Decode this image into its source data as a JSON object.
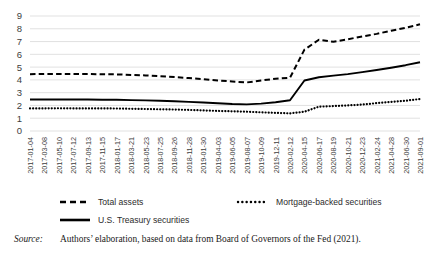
{
  "figure": {
    "source_label": "Source:",
    "source_text": "Authors’ elaboration, based on data from Board of Governors of the Fed (2021)."
  },
  "chart_data": {
    "type": "line",
    "title": "",
    "xlabel": "",
    "ylabel": "",
    "ylim": [
      0,
      9
    ],
    "yticks": [
      0,
      1,
      2,
      3,
      4,
      5,
      6,
      7,
      8,
      9
    ],
    "grid": true,
    "legend_position": "bottom",
    "colors": {
      "line": "#000000",
      "grid": "#d9d9d9",
      "text": "#3d3d3d"
    },
    "categories": [
      "2017-01-04",
      "2017-03-08",
      "2017-05-10",
      "2017-07-12",
      "2017-09-13",
      "2017-11-15",
      "2018-01-17",
      "2018-03-21",
      "2018-05-23",
      "2018-07-25",
      "2018-09-26",
      "2018-11-28",
      "2019-01-30",
      "2019-04-03",
      "2019-06-05",
      "2019-08-07",
      "2019-10-09",
      "2019-12-11",
      "2020-02-12",
      "2020-04-15",
      "2020-06-17",
      "2020-08-19",
      "2020-10-21",
      "2020-12-23",
      "2021-02-24",
      "2021-04-28",
      "2021-06-30",
      "2021-09-01"
    ],
    "series": [
      {
        "name": "Total assets",
        "style": "dashed",
        "values": [
          4.45,
          4.47,
          4.47,
          4.47,
          4.46,
          4.44,
          4.43,
          4.39,
          4.35,
          4.29,
          4.22,
          4.14,
          4.06,
          3.96,
          3.87,
          3.8,
          3.95,
          4.09,
          4.17,
          6.37,
          7.14,
          6.98,
          7.18,
          7.4,
          7.6,
          7.85,
          8.08,
          8.35
        ]
      },
      {
        "name": "Mortgage-backed securities",
        "style": "dotted",
        "values": [
          1.77,
          1.77,
          1.78,
          1.77,
          1.77,
          1.77,
          1.76,
          1.74,
          1.72,
          1.7,
          1.68,
          1.65,
          1.61,
          1.57,
          1.54,
          1.51,
          1.46,
          1.42,
          1.38,
          1.51,
          1.9,
          1.95,
          2.0,
          2.07,
          2.18,
          2.27,
          2.37,
          2.5
        ]
      },
      {
        "name": "U.S. Treasury securities",
        "style": "solid",
        "values": [
          2.46,
          2.46,
          2.46,
          2.46,
          2.46,
          2.45,
          2.45,
          2.42,
          2.4,
          2.37,
          2.33,
          2.28,
          2.23,
          2.17,
          2.11,
          2.08,
          2.14,
          2.25,
          2.41,
          3.95,
          4.21,
          4.33,
          4.45,
          4.61,
          4.77,
          4.95,
          5.15,
          5.38
        ]
      }
    ],
    "legend": [
      {
        "name": "Total assets",
        "style": "dashed"
      },
      {
        "name": "Mortgage-backed securities",
        "style": "dotted"
      },
      {
        "name": "U.S. Treasury securities",
        "style": "solid"
      }
    ]
  }
}
